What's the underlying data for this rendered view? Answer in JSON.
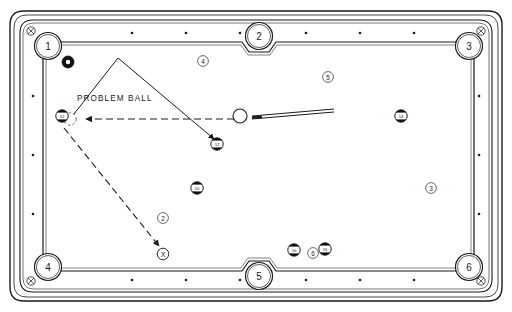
{
  "diagram": {
    "title": "PROBLEM BALL",
    "type": "pool-table-shot-diagram",
    "annotation_label": "PROBLEM BALL",
    "target_marker_label": "X",
    "colors": {
      "ink": "#1a1a1a",
      "rail_fill": "#ffffff",
      "cloth_fill": "#ffffff",
      "ball_dark": "#111111",
      "ball_light": "#ffffff",
      "frame_outer": "#2b2b2b"
    }
  },
  "pockets": [
    {
      "id": "pocket-1",
      "label": "1",
      "cx": 48,
      "cy": 46
    },
    {
      "id": "pocket-2",
      "label": "2",
      "cx": 259,
      "cy": 36
    },
    {
      "id": "pocket-3",
      "label": "3",
      "cx": 469,
      "cy": 46
    },
    {
      "id": "pocket-4",
      "label": "4",
      "cx": 48,
      "cy": 267
    },
    {
      "id": "pocket-5",
      "label": "5",
      "cx": 259,
      "cy": 276
    },
    {
      "id": "pocket-6",
      "label": "6",
      "cx": 469,
      "cy": 267
    }
  ],
  "spot_markers": [
    {
      "id": "spot-4",
      "label": "4",
      "cx": 203,
      "cy": 61
    },
    {
      "id": "spot-5",
      "label": "5",
      "cx": 328,
      "cy": 77
    },
    {
      "id": "spot-3",
      "label": "3",
      "cx": 431,
      "cy": 188
    },
    {
      "id": "spot-2",
      "label": "2",
      "cx": 163,
      "cy": 218
    },
    {
      "id": "spot-6",
      "label": "6",
      "cx": 313,
      "cy": 253
    }
  ],
  "target_marker": {
    "id": "target-x",
    "label": "X",
    "cx": 163,
    "cy": 254
  },
  "balls": [
    {
      "id": "ball-eight-corner",
      "kind": "solid-dark",
      "number": "",
      "cx": 68,
      "cy": 62,
      "r": 6
    },
    {
      "id": "ball-problem",
      "kind": "striped",
      "number": "12",
      "cx": 62,
      "cy": 116,
      "r": 6
    },
    {
      "id": "ball-ghost",
      "kind": "ghost",
      "number": "",
      "cx": 70,
      "cy": 119,
      "r": 6
    },
    {
      "id": "ball-object-mid",
      "kind": "striped",
      "number": "12",
      "cx": 217,
      "cy": 144,
      "r": 6
    },
    {
      "id": "ball-lower-left",
      "kind": "striped",
      "number": "10",
      "cx": 197,
      "cy": 188,
      "r": 6
    },
    {
      "id": "ball-right",
      "kind": "striped",
      "number": "14",
      "cx": 401,
      "cy": 116,
      "r": 6
    },
    {
      "id": "ball-bottom-a",
      "kind": "striped",
      "number": "10",
      "cx": 294,
      "cy": 250,
      "r": 6
    },
    {
      "id": "ball-bottom-b",
      "kind": "striped",
      "number": "15",
      "cx": 325,
      "cy": 249,
      "r": 6
    },
    {
      "id": "ball-cue",
      "kind": "cue",
      "number": "",
      "cx": 240,
      "cy": 116,
      "r": 7
    }
  ],
  "cue_stick": {
    "id": "cue-stick",
    "x1": 252,
    "y1": 116,
    "x2": 332,
    "y2": 110
  },
  "paths": {
    "aim_line_solid": {
      "id": "aim-path-solid",
      "points": "70,119 118,58 216,141",
      "style": "solid",
      "arrow_at_end": true
    },
    "cueball_path_dashed": {
      "id": "cueball-path-dashed",
      "x1": 236,
      "y1": 119,
      "x2": 84,
      "y2": 119,
      "style": "dashed",
      "arrow_at_end": true
    },
    "position_path_dashed": {
      "id": "position-path-dashed",
      "x1": 64,
      "y1": 128,
      "x2": 160,
      "y2": 247,
      "style": "dashed",
      "arrow_at_end": true
    }
  },
  "rail_diamonds": {
    "top": [
      {
        "x": 132,
        "y": 33
      },
      {
        "x": 186,
        "y": 33
      },
      {
        "x": 240,
        "y": 33
      }
    ],
    "top2": [
      {
        "x": 306,
        "y": 33
      },
      {
        "x": 360,
        "y": 33
      },
      {
        "x": 414,
        "y": 33
      }
    ],
    "bottom": [
      {
        "x": 132,
        "y": 280
      },
      {
        "x": 186,
        "y": 280
      },
      {
        "x": 240,
        "y": 280
      }
    ],
    "bottom2": [
      {
        "x": 306,
        "y": 280
      },
      {
        "x": 360,
        "y": 280
      },
      {
        "x": 414,
        "y": 280
      }
    ],
    "left": [
      {
        "x": 33,
        "y": 96
      },
      {
        "x": 33,
        "y": 155
      },
      {
        "x": 33,
        "y": 214
      }
    ],
    "right": [
      {
        "x": 479,
        "y": 96
      },
      {
        "x": 479,
        "y": 155
      },
      {
        "x": 479,
        "y": 214
      }
    ]
  }
}
